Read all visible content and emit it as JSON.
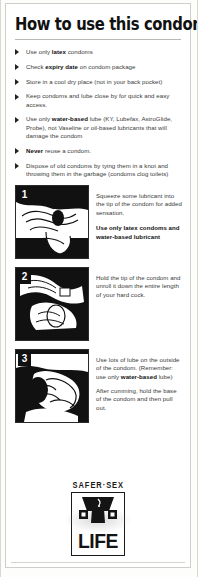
{
  "document": {
    "title": "How to use this condom",
    "bullets": [
      {
        "segments": [
          {
            "t": "Use only ",
            "b": false
          },
          {
            "t": "latex",
            "b": true
          },
          {
            "t": " condoms",
            "b": false
          }
        ]
      },
      {
        "segments": [
          {
            "t": "Check ",
            "b": false
          },
          {
            "t": "expiry date",
            "b": true
          },
          {
            "t": " on condom package",
            "b": false
          }
        ]
      },
      {
        "segments": [
          {
            "t": "Store in a cool dry place (not in your back pocket)",
            "b": false
          }
        ]
      },
      {
        "segments": [
          {
            "t": "Keep condoms and lube close by for quick and easy access.",
            "b": false
          }
        ]
      },
      {
        "segments": [
          {
            "t": "Use only ",
            "b": false
          },
          {
            "t": "water-based",
            "b": true
          },
          {
            "t": " lube (KY, Lubefax, AstroGlide, Probe), not Vaseline or oil-based lubricants that will damage the condom",
            "b": false
          }
        ]
      },
      {
        "segments": [
          {
            "t": "Never",
            "b": true
          },
          {
            "t": " reuse a condom.",
            "b": false
          }
        ]
      },
      {
        "segments": [
          {
            "t": "Dispose of old condoms by tying them in a knot and throwing them in the garbage (condoms clog toilets)",
            "b": false
          }
        ]
      }
    ],
    "steps": [
      {
        "number": "1",
        "image_alt": "hands-squeezing-lubricant-into-condom-tip",
        "paragraphs": [
          {
            "bold_line": false,
            "segments": [
              {
                "t": "Squeeze some lubricant into the tip of the condom for added sensation.",
                "b": false
              }
            ]
          },
          {
            "bold_line": true,
            "segments": [
              {
                "t": "Use only latex condoms and water-based lubricant",
                "b": true
              }
            ]
          }
        ]
      },
      {
        "number": "2",
        "image_alt": "hands-unrolling-condom-onto-erect-penis",
        "paragraphs": [
          {
            "bold_line": false,
            "segments": [
              {
                "t": "Hold the tip of the condom and unroll it down the entire length of your hard cock.",
                "b": false
              }
            ]
          }
        ]
      },
      {
        "number": "3",
        "image_alt": "hand-applying-lube-to-outside-of-condom",
        "paragraphs": [
          {
            "bold_line": false,
            "segments": [
              {
                "t": "Use lots of lube on the outside of the condom. (Remember: use only ",
                "b": false
              },
              {
                "t": "water-based",
                "b": true
              },
              {
                "t": " lube)",
                "b": false
              }
            ]
          },
          {
            "bold_line": false,
            "segments": [
              {
                "t": "After cumming, hold the base of the condom and then pull out.",
                "b": false
              }
            ]
          }
        ]
      }
    ],
    "logo": {
      "top_text": "SAFER·SEX",
      "word": "LIFE"
    },
    "colors": {
      "ink": "#111111",
      "body_text": "#3a3a3a",
      "page": "#ffffff",
      "border": "#cfcfca",
      "badge_bg": "#111111",
      "badge_text": "#ffffff"
    }
  }
}
